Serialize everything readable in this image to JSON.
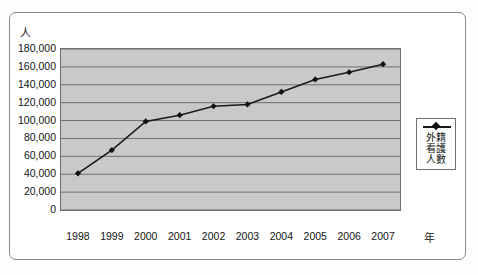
{
  "chart_data": {
    "type": "line",
    "title": "",
    "xlabel": "年",
    "ylabel": "人",
    "categories": [
      "1998",
      "1999",
      "2000",
      "2001",
      "2002",
      "2003",
      "2004",
      "2005",
      "2006",
      "2007"
    ],
    "series": [
      {
        "name": "外籍看護人數",
        "values": [
          41000,
          67000,
          99000,
          106000,
          116000,
          118000,
          132000,
          146000,
          154000,
          163000
        ]
      }
    ],
    "ylim": [
      0,
      180000
    ],
    "ytick_values": [
      0,
      20000,
      40000,
      60000,
      80000,
      100000,
      120000,
      140000,
      160000,
      180000
    ],
    "ytick_labels": [
      "0",
      "20,000",
      "40,000",
      "60,000",
      "80,000",
      "100,000",
      "120,000",
      "140,000",
      "160,000",
      "180,000"
    ],
    "grid": true,
    "grid_axis": "y",
    "legend_position": "right",
    "marker": "diamond",
    "line_color": "#1a1a1a",
    "marker_color": "#111111",
    "plot_background": "#c9c9c9",
    "grid_color": "#6f6f6f"
  },
  "axes": {
    "y_unit_label": "人",
    "x_unit_label": "年"
  },
  "legend": {
    "marker_icon": "line-diamond-marker",
    "label_lines": [
      "外籍",
      "看護",
      "人數"
    ],
    "full_label": "外籍看護人數"
  }
}
